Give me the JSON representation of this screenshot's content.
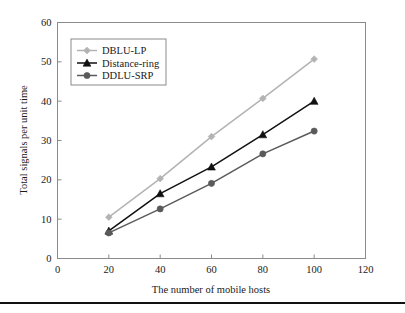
{
  "chart_data": {
    "type": "line",
    "title": "",
    "xlabel": "The number of mobile hosts",
    "ylabel": "Total signals per unit time",
    "x": [
      20,
      40,
      60,
      80,
      100
    ],
    "xlim": [
      0,
      120
    ],
    "ylim": [
      0,
      60
    ],
    "xticks": [
      0,
      20,
      40,
      60,
      80,
      100,
      120
    ],
    "yticks": [
      0,
      10,
      20,
      30,
      40,
      50,
      60
    ],
    "grid": false,
    "legend_position": "upper-left",
    "series": [
      {
        "name": "DBLU-LP",
        "values": [
          10.5,
          20.3,
          31.0,
          40.7,
          50.7
        ],
        "color": "#b3b3b3",
        "marker": "diamond"
      },
      {
        "name": "Distance-ring",
        "values": [
          7.0,
          16.5,
          23.3,
          31.5,
          40.0
        ],
        "color": "#111111",
        "marker": "triangle"
      },
      {
        "name": "DDLU-SRP",
        "values": [
          6.5,
          12.6,
          19.1,
          26.6,
          32.4
        ],
        "color": "#5a5a5a",
        "marker": "circle"
      }
    ]
  },
  "axis": {
    "x_tick_labels": [
      "0",
      "20",
      "40",
      "60",
      "80",
      "100",
      "120"
    ],
    "y_tick_labels": [
      "0",
      "10",
      "20",
      "30",
      "40",
      "50",
      "60"
    ],
    "x_title": "The number of mobile hosts",
    "y_title": "Total signals per unit time"
  },
  "legend": {
    "entries": [
      {
        "label": "DBLU-LP"
      },
      {
        "label": "Distance-ring"
      },
      {
        "label": "DDLU-SRP"
      }
    ]
  }
}
